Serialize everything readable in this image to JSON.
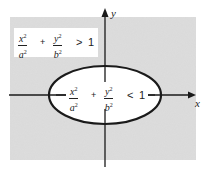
{
  "figure": {
    "type": "ellipse-region-diagram",
    "axes": {
      "x_label": "x",
      "y_label": "y"
    },
    "outside_region": {
      "term1_num": "x",
      "term1_den": "a",
      "term2_num": "y",
      "term2_den": "b",
      "exponent": "2",
      "plus": "+",
      "relation": ">",
      "rhs": "1",
      "shading": "gray"
    },
    "inside_region": {
      "term1_num": "x",
      "term1_den": "a",
      "term2_num": "y",
      "term2_den": "b",
      "exponent": "2",
      "plus": "+",
      "relation": "<",
      "rhs": "1",
      "shading": "white"
    },
    "colors": {
      "shade": "#d9d9d9",
      "ink": "#1a1a1a",
      "box": "#ffffff"
    }
  }
}
